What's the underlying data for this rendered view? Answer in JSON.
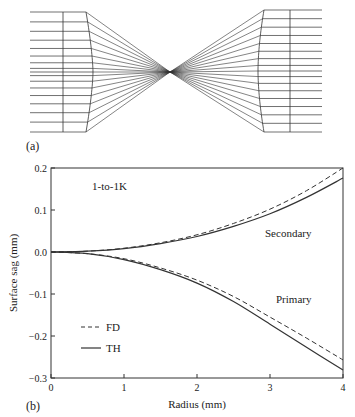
{
  "panel_a": {
    "label": "(a)",
    "description": "Ray trace of 1-to-1K beam shaping: collimated beam converges through focus then re-collimates",
    "ray_count": 17
  },
  "panel_b": {
    "label": "(b)",
    "annotation": "1-to-1K",
    "curve_labels": {
      "secondary": "Secondary",
      "primary": "Primary"
    },
    "legend": [
      {
        "name": "FD",
        "style": "dashed"
      },
      {
        "name": "TH",
        "style": "solid"
      }
    ]
  },
  "chart_data": {
    "type": "line",
    "title": "1-to-1K",
    "xlabel": "Radius (mm)",
    "ylabel": "Surface sag (mm)",
    "xlim": [
      0,
      4
    ],
    "ylim": [
      -0.3,
      0.2
    ],
    "xticks": [
      "0",
      "1",
      "2",
      "3",
      "4"
    ],
    "yticks": [
      "0.2",
      "0.1",
      "0.0",
      "−0.1",
      "−0.2",
      "−0.3"
    ],
    "grid": false,
    "legend_position": "lower left",
    "x": [
      0,
      0.5,
      1,
      1.5,
      2,
      2.5,
      3,
      3.5,
      4
    ],
    "series": [
      {
        "name": "Secondary FD",
        "style": "dashed",
        "values": [
          0,
          0.002,
          0.009,
          0.022,
          0.041,
          0.068,
          0.102,
          0.146,
          0.2
        ]
      },
      {
        "name": "Secondary TH",
        "style": "solid",
        "values": [
          0,
          0.002,
          0.008,
          0.02,
          0.037,
          0.061,
          0.091,
          0.13,
          0.176
        ]
      },
      {
        "name": "Primary FD",
        "style": "dashed",
        "values": [
          0,
          -0.004,
          -0.016,
          -0.038,
          -0.067,
          -0.106,
          -0.155,
          -0.205,
          -0.257
        ]
      },
      {
        "name": "Primary TH",
        "style": "solid",
        "values": [
          0,
          -0.004,
          -0.018,
          -0.042,
          -0.074,
          -0.118,
          -0.172,
          -0.227,
          -0.281
        ]
      }
    ]
  }
}
